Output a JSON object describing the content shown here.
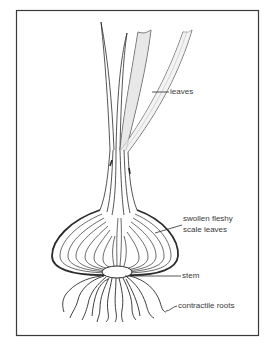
{
  "figure": {
    "frame_color": "#3a3a3a",
    "line_color": "#2b2b2b",
    "background": "#ffffff"
  },
  "labels": {
    "leaves": "leaves",
    "scale_leaves_line1": "swollen fleshy",
    "scale_leaves_line2": "scale leaves",
    "stem": "stem",
    "roots": "contractile roots"
  }
}
